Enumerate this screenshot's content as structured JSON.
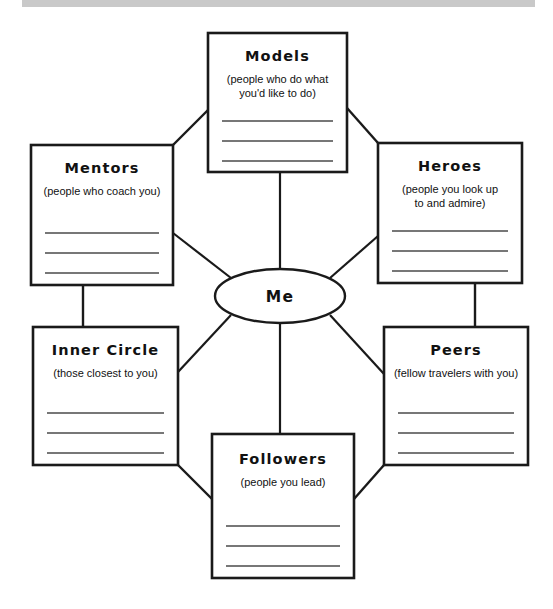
{
  "page": {
    "background_color": "#ffffff",
    "top_bar_color": "#c9c9c9",
    "line_color": "#1a1a1a",
    "write_line_color": "#4a4a4a"
  },
  "hub": {
    "label": "Me",
    "cx": 280,
    "cy": 296,
    "rx": 65,
    "ry": 27
  },
  "nodes": [
    {
      "id": "models",
      "title": "Models",
      "description_lines": [
        "(people who do what",
        "you'd like to do)"
      ],
      "x": 208,
      "y": 33,
      "width": 139,
      "height": 139,
      "write_lines": 3,
      "title_dy": 28,
      "desc_dy": 50,
      "lines_start_dy": 88
    },
    {
      "id": "mentors",
      "title": "Mentors",
      "description_lines": [
        "(people who coach you)"
      ],
      "x": 31,
      "y": 145,
      "width": 142,
      "height": 140,
      "write_lines": 3,
      "title_dy": 28,
      "desc_dy": 50,
      "lines_start_dy": 88
    },
    {
      "id": "heroes",
      "title": "Heroes",
      "description_lines": [
        "(people you look up",
        "to and admire)"
      ],
      "x": 378,
      "y": 143,
      "width": 144,
      "height": 140,
      "write_lines": 3,
      "title_dy": 28,
      "desc_dy": 50,
      "lines_start_dy": 88
    },
    {
      "id": "inner-circle",
      "title": "Inner Circle",
      "description_lines": [
        "(those closest to you)"
      ],
      "x": 33,
      "y": 327,
      "width": 145,
      "height": 138,
      "write_lines": 3,
      "title_dy": 28,
      "desc_dy": 50,
      "lines_start_dy": 86
    },
    {
      "id": "peers",
      "title": "Peers",
      "description_lines": [
        "(fellow travelers with you)"
      ],
      "x": 384,
      "y": 327,
      "width": 144,
      "height": 138,
      "write_lines": 3,
      "title_dy": 28,
      "desc_dy": 50,
      "lines_start_dy": 86
    },
    {
      "id": "followers",
      "title": "Followers",
      "description_lines": [
        "(people you lead)"
      ],
      "x": 212,
      "y": 434,
      "width": 142,
      "height": 144,
      "write_lines": 3,
      "title_dy": 30,
      "desc_dy": 52,
      "lines_start_dy": 92
    }
  ],
  "spokes": [
    {
      "id": "hub-to-models",
      "from": "hub",
      "to": "models",
      "x1": 280,
      "y1": 269,
      "x2": 280,
      "y2": 172
    },
    {
      "id": "hub-to-mentors",
      "from": "hub",
      "to": "mentors",
      "x1": 231,
      "y1": 278,
      "x2": 173,
      "y2": 233
    },
    {
      "id": "hub-to-heroes",
      "from": "hub",
      "to": "heroes",
      "x1": 330,
      "y1": 278,
      "x2": 378,
      "y2": 236
    },
    {
      "id": "hub-to-inner-circle",
      "from": "hub",
      "to": "inner-circle",
      "x1": 231,
      "y1": 315,
      "x2": 178,
      "y2": 372
    },
    {
      "id": "hub-to-peers",
      "from": "hub",
      "to": "peers",
      "x1": 330,
      "y1": 315,
      "x2": 384,
      "y2": 374
    },
    {
      "id": "hub-to-followers",
      "from": "hub",
      "to": "followers",
      "x1": 280,
      "y1": 323,
      "x2": 280,
      "y2": 434
    }
  ],
  "perimeter_connectors": [
    {
      "id": "mentors-to-models",
      "x1": 173,
      "y1": 145,
      "x2": 208,
      "y2": 110
    },
    {
      "id": "models-to-heroes",
      "x1": 347,
      "y1": 108,
      "x2": 378,
      "y2": 143
    },
    {
      "id": "mentors-to-inner-circle",
      "x1": 83,
      "y1": 285,
      "x2": 83,
      "y2": 327
    },
    {
      "id": "heroes-to-peers",
      "x1": 475,
      "y1": 283,
      "x2": 475,
      "y2": 327
    },
    {
      "id": "inner-circle-to-followers",
      "x1": 178,
      "y1": 465,
      "x2": 212,
      "y2": 499
    },
    {
      "id": "peers-to-followers",
      "x1": 354,
      "y1": 499,
      "x2": 384,
      "y2": 465
    }
  ]
}
